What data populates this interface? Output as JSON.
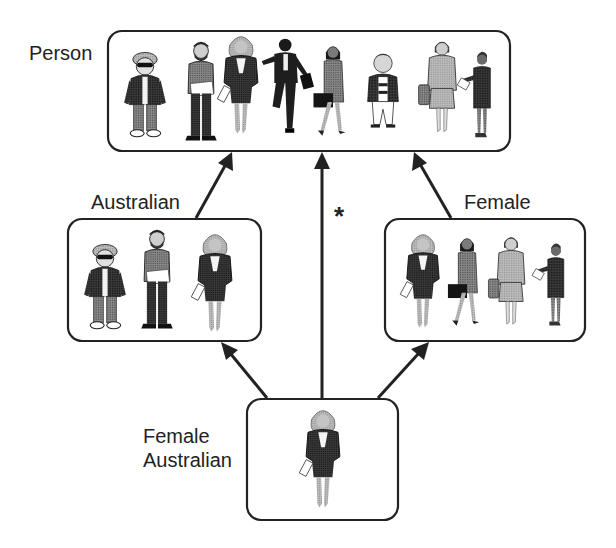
{
  "diagram": {
    "type": "class-hierarchy",
    "colors": {
      "stroke": "#222222",
      "background": "#ffffff",
      "figure_dark": "#2a2a2a",
      "figure_mid": "#6e6e6e",
      "figure_light": "#b8b8b8",
      "skin": "#c9c9c9"
    },
    "nodes": [
      {
        "id": "person",
        "label": "Person",
        "members": [
          "boy-cap-sunglasses",
          "bearded-man",
          "blonde-woman-suit",
          "running-businessman",
          "woman-briefcase",
          "boy-sweater",
          "woman-grey-suit",
          "woman-talking"
        ]
      },
      {
        "id": "australian",
        "label": "Australian",
        "members": [
          "boy-cap-sunglasses",
          "bearded-man",
          "blonde-woman-suit"
        ]
      },
      {
        "id": "female",
        "label": "Female",
        "members": [
          "blonde-woman-suit",
          "woman-briefcase",
          "woman-grey-suit",
          "woman-talking"
        ]
      },
      {
        "id": "female-australian",
        "label_lines": [
          "Female",
          "Australian"
        ],
        "members": [
          "blonde-woman-suit"
        ]
      }
    ],
    "edges": [
      {
        "from": "australian",
        "to": "person"
      },
      {
        "from": "female",
        "to": "person"
      },
      {
        "from": "female-australian",
        "to": "person",
        "annotation": "*"
      },
      {
        "from": "female-australian",
        "to": "australian"
      },
      {
        "from": "female-australian",
        "to": "female"
      }
    ],
    "annotation_text": "*"
  }
}
